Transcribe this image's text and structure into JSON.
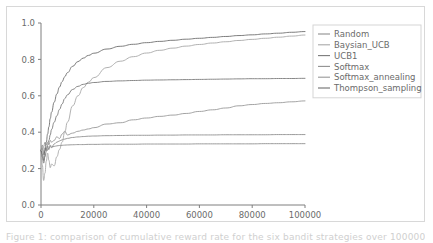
{
  "figure": {
    "background_color": "#ffffff",
    "frame_color": "#d8d8d8",
    "axis_color": "#7f7f7f",
    "tick_label_color": "#6b6b6b",
    "legend_border_color": "#d5d5d5"
  },
  "caption": {
    "text": "Figure 1: comparison of cumulative reward rate for the six bandit strategies over 100000 trials."
  },
  "chart_data": {
    "type": "line",
    "title": "",
    "xlabel": "",
    "ylabel": "",
    "xlim": [
      0,
      100000
    ],
    "ylim": [
      0.0,
      1.0
    ],
    "grid": false,
    "legend_position": "right",
    "xticks": [
      0,
      20000,
      40000,
      60000,
      80000,
      100000
    ],
    "xtick_labels": [
      "0",
      "20000",
      "40000",
      "60000",
      "80000",
      "100000"
    ],
    "yticks": [
      0.0,
      0.2,
      0.4,
      0.6,
      0.8,
      1.0
    ],
    "ytick_labels": [
      "0.0",
      "0.2",
      "0.4",
      "0.6",
      "0.8",
      "1.0"
    ],
    "x": [
      0,
      500,
      1000,
      1500,
      2000,
      2500,
      3000,
      3500,
      4000,
      5000,
      6000,
      7000,
      8000,
      9000,
      10000,
      12000,
      14000,
      16000,
      18000,
      20000,
      25000,
      30000,
      35000,
      40000,
      45000,
      50000,
      55000,
      60000,
      65000,
      70000,
      75000,
      80000,
      85000,
      90000,
      95000,
      100000
    ],
    "series": [
      {
        "name": "Random",
        "color": "#8f8f8f",
        "values": [
          0.3,
          0.33,
          0.28,
          0.315,
          0.3,
          0.325,
          0.305,
          0.33,
          0.315,
          0.335,
          0.345,
          0.352,
          0.358,
          0.362,
          0.366,
          0.371,
          0.374,
          0.376,
          0.378,
          0.379,
          0.381,
          0.382,
          0.383,
          0.383,
          0.384,
          0.384,
          0.385,
          0.385,
          0.385,
          0.386,
          0.386,
          0.386,
          0.386,
          0.387,
          0.387,
          0.387
        ]
      },
      {
        "name": "Baysian_UCB",
        "color": "#a8a8a8",
        "values": [
          0.3,
          0.22,
          0.135,
          0.175,
          0.24,
          0.285,
          0.245,
          0.205,
          0.225,
          0.215,
          0.265,
          0.305,
          0.345,
          0.4,
          0.455,
          0.545,
          0.6,
          0.645,
          0.675,
          0.7,
          0.755,
          0.79,
          0.815,
          0.835,
          0.85,
          0.862,
          0.873,
          0.882,
          0.89,
          0.897,
          0.904,
          0.91,
          0.916,
          0.922,
          0.928,
          0.934
        ]
      },
      {
        "name": "UCB1",
        "color": "#7a7a7a",
        "values": [
          0.3,
          0.265,
          0.23,
          0.265,
          0.295,
          0.33,
          0.355,
          0.385,
          0.415,
          0.455,
          0.49,
          0.525,
          0.555,
          0.585,
          0.605,
          0.635,
          0.652,
          0.663,
          0.669,
          0.673,
          0.679,
          0.682,
          0.684,
          0.686,
          0.687,
          0.688,
          0.689,
          0.69,
          0.691,
          0.692,
          0.693,
          0.694,
          0.694,
          0.695,
          0.695,
          0.696
        ]
      },
      {
        "name": "Softmax",
        "color": "#909090",
        "values": [
          0.3,
          0.31,
          0.275,
          0.295,
          0.31,
          0.3,
          0.315,
          0.32,
          0.318,
          0.322,
          0.325,
          0.327,
          0.328,
          0.329,
          0.33,
          0.331,
          0.332,
          0.332,
          0.333,
          0.333,
          0.334,
          0.334,
          0.334,
          0.335,
          0.335,
          0.335,
          0.335,
          0.336,
          0.336,
          0.336,
          0.336,
          0.336,
          0.337,
          0.337,
          0.337,
          0.337
        ]
      },
      {
        "name": "Softmax_annealing",
        "color": "#999999",
        "values": [
          0.3,
          0.305,
          0.32,
          0.345,
          0.33,
          0.345,
          0.33,
          0.355,
          0.345,
          0.355,
          0.375,
          0.365,
          0.39,
          0.405,
          0.385,
          0.395,
          0.405,
          0.412,
          0.418,
          0.425,
          0.445,
          0.452,
          0.468,
          0.478,
          0.487,
          0.494,
          0.503,
          0.514,
          0.523,
          0.533,
          0.545,
          0.552,
          0.558,
          0.562,
          0.567,
          0.572
        ]
      },
      {
        "name": "Thompson_sampling",
        "color": "#6e6e6e",
        "values": [
          0.3,
          0.28,
          0.245,
          0.3,
          0.345,
          0.39,
          0.43,
          0.475,
          0.51,
          0.565,
          0.61,
          0.648,
          0.678,
          0.705,
          0.727,
          0.762,
          0.788,
          0.807,
          0.822,
          0.834,
          0.857,
          0.872,
          0.883,
          0.892,
          0.899,
          0.905,
          0.911,
          0.916,
          0.921,
          0.926,
          0.931,
          0.935,
          0.94,
          0.944,
          0.949,
          0.953
        ]
      }
    ]
  }
}
